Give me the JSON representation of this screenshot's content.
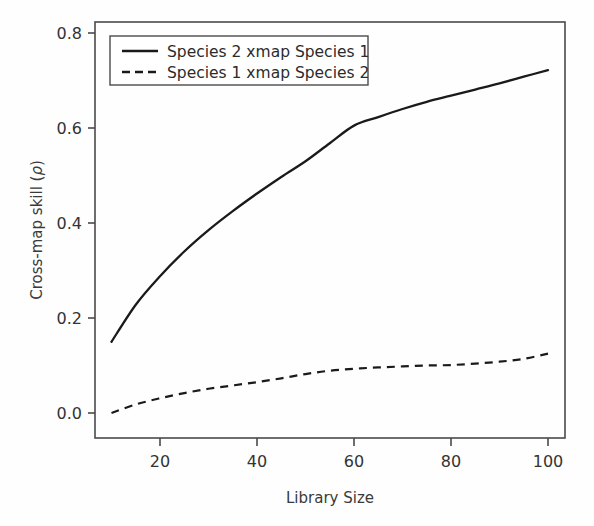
{
  "chart_data": {
    "type": "line",
    "title": "",
    "xlabel": "Library Size",
    "ylabel": "Cross-map skill (ρ)",
    "xlim": [
      10,
      100
    ],
    "ylim": [
      0.0,
      0.8
    ],
    "xticks": [
      20,
      40,
      60,
      80,
      100
    ],
    "xtick_labels": [
      "20",
      "40",
      "60",
      "80",
      "100"
    ],
    "yticks": [
      0.0,
      0.2,
      0.4,
      0.6,
      0.8
    ],
    "ytick_labels": [
      "0.0",
      "0.2",
      "0.4",
      "0.6",
      "0.8"
    ],
    "grid": false,
    "legend_position": "top-left",
    "x": [
      10,
      15,
      20,
      25,
      30,
      35,
      40,
      45,
      50,
      55,
      60,
      65,
      70,
      75,
      80,
      85,
      90,
      95,
      100
    ],
    "series": [
      {
        "name": "Species 2 xmap Species 1",
        "style": "solid",
        "color": "#1a1a1a",
        "values": [
          0.15,
          0.228,
          0.288,
          0.34,
          0.385,
          0.425,
          0.462,
          0.497,
          0.53,
          0.568,
          0.605,
          0.623,
          0.64,
          0.655,
          0.668,
          0.681,
          0.694,
          0.708,
          0.722
        ]
      },
      {
        "name": "Species 1 xmap Species 2",
        "style": "dashed",
        "color": "#1a1a1a",
        "values": [
          0.0,
          0.018,
          0.031,
          0.042,
          0.051,
          0.058,
          0.065,
          0.073,
          0.082,
          0.089,
          0.093,
          0.096,
          0.098,
          0.1,
          0.101,
          0.104,
          0.108,
          0.114,
          0.125
        ]
      }
    ]
  },
  "legend": {
    "entries": [
      {
        "label": "Species 2 xmap Species 1",
        "style": "solid"
      },
      {
        "label": "Species 1 xmap Species 2",
        "style": "dashed"
      }
    ]
  },
  "axes": {
    "x_title": "Library Size",
    "y_title_prefix": "Cross-map skill (",
    "y_title_symbol": "ρ",
    "y_title_suffix": ")"
  },
  "colors": {
    "line": "#1a1a1a",
    "frame": "#4a4a4a",
    "text": "#333333",
    "background": "#fefefe"
  }
}
